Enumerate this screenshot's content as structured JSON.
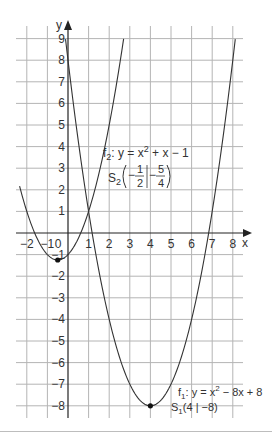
{
  "chart_data": {
    "type": "line",
    "title": "",
    "xlabel": "x",
    "ylabel": "y",
    "xlim": [
      -2.5,
      8.5
    ],
    "ylim": [
      -8.5,
      9.5
    ],
    "grid": true,
    "x_ticks": [
      -2,
      -1,
      0,
      1,
      2,
      3,
      4,
      5,
      6,
      7,
      8
    ],
    "x_tick_labels": [
      "−2",
      "−1",
      "0",
      "1",
      "2",
      "3",
      "4",
      "5",
      "6",
      "7",
      "8"
    ],
    "y_ticks": [
      9,
      8,
      7,
      6,
      5,
      4,
      3,
      2,
      1,
      -1,
      -2,
      -3,
      -4,
      -5,
      -6,
      -7,
      -8
    ],
    "y_tick_labels": [
      "9",
      "8",
      "7",
      "6",
      "5",
      "4",
      "3",
      "2",
      "1",
      "−1",
      "−2",
      "−3",
      "−4",
      "−5",
      "−6",
      "−7",
      "−8"
    ],
    "series": [
      {
        "name": "f1",
        "equation": "y = x² − 8x + 8",
        "coefficients": {
          "a": 1,
          "b": -8,
          "c": 8
        },
        "x_range": [
          -0.12,
          8.12
        ],
        "x": [
          -0.12,
          0,
          1,
          2,
          3,
          4,
          5,
          6,
          7,
          8,
          8.12
        ],
        "values": [
          9,
          8,
          1,
          -4,
          -7,
          -8,
          -7,
          -4,
          1,
          8,
          9
        ],
        "vertex": {
          "label": "S₁(4 | −8)",
          "x": 4,
          "y": -8
        }
      },
      {
        "name": "f2",
        "equation": "y = x² + x − 1",
        "coefficients": {
          "a": 1,
          "b": 1,
          "c": -1
        },
        "x_range": [
          -2.35,
          2.7
        ],
        "x": [
          -2.35,
          -2,
          -1,
          -0.5,
          0,
          1,
          2,
          2.7
        ],
        "values": [
          2.17,
          1,
          -1,
          -1.25,
          -1,
          1,
          5,
          9
        ],
        "vertex": {
          "label": "S₂(−1/2 | −5/4)",
          "x": -0.5,
          "y": -1.25
        }
      }
    ],
    "annotations": [
      {
        "target": "f2",
        "name": "f",
        "sub": "2",
        "eq_before": ":  y = x",
        "sup": "2",
        "eq_after": " + x − 1"
      },
      {
        "target": "S2",
        "name": "S",
        "sub": "2",
        "x_num": "1",
        "x_den": "2",
        "y_num": "5",
        "y_den": "4",
        "sign": "−"
      },
      {
        "target": "f1",
        "name": "f",
        "sub": "1",
        "eq_before": ": y = x",
        "sup": "2",
        "eq_after": " − 8x + 8"
      },
      {
        "target": "S1",
        "name": "S",
        "sub": "1",
        "coords": "(4 | −8)"
      }
    ]
  },
  "labels": {
    "x_axis": "x",
    "y_axis": "y",
    "f2_name": "f",
    "f2_sub": "2",
    "f2_eq_a": ":  y = x",
    "f2_sup": "2",
    "f2_eq_b": " + x − 1",
    "s2_name": "S",
    "s2_sub": "2",
    "s2_minus1": "−",
    "s2_xnum": "1",
    "s2_xden": "2",
    "s2_minus2": "−",
    "s2_ynum": "5",
    "s2_yden": "4",
    "f1_name": "f",
    "f1_sub": "1",
    "f1_eq_a": ": y = x",
    "f1_sup": "2",
    "f1_eq_b": " − 8x + 8",
    "s1_name": "S",
    "s1_sub": "1",
    "s1_coords": "(4 | −8)"
  },
  "colors": {
    "grid": "#b4b4b4",
    "axis": "#222222",
    "curve": "#333333",
    "text": "#333333",
    "background": "#ffffff"
  }
}
